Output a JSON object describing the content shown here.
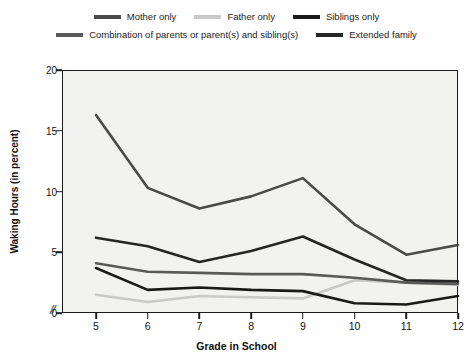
{
  "chart_data": {
    "type": "line",
    "title": "",
    "xlabel": "Grade in School",
    "ylabel": "Waking Hours (in percent)",
    "x": [
      5,
      6,
      7,
      8,
      9,
      10,
      11,
      12
    ],
    "xtick_labels": [
      "5",
      "6",
      "7",
      "8",
      "9",
      "10",
      "11",
      "12"
    ],
    "ytick_labels": [
      "0",
      "5",
      "10",
      "15",
      "20"
    ],
    "ytick_values": [
      0,
      5,
      10,
      15,
      20
    ],
    "ylim": [
      0,
      20
    ],
    "xlim": [
      5,
      12
    ],
    "x_axis_break": true,
    "x_axis_break_symbol": "//",
    "grid": false,
    "legend_position": "top",
    "plot_background": "#f2f2f0",
    "axis_color": "#1b1b1b",
    "series": [
      {
        "name": "Mother only",
        "color": "#4a4a4a",
        "values": [
          16.3,
          10.3,
          8.6,
          9.6,
          11.1,
          7.3,
          4.8,
          5.6
        ]
      },
      {
        "name": "Father only",
        "color": "#c9c9c9",
        "values": [
          1.5,
          0.9,
          1.4,
          1.3,
          1.2,
          2.7,
          2.5,
          2.3
        ]
      },
      {
        "name": "Siblings only",
        "color": "#1a1a1a",
        "values": [
          3.7,
          1.9,
          2.1,
          1.9,
          1.8,
          0.8,
          0.7,
          1.4
        ]
      },
      {
        "name": "Combination of parents or parent(s) and sibling(s)",
        "color": "#5a5a5a",
        "values": [
          4.1,
          3.4,
          3.3,
          3.2,
          3.2,
          2.9,
          2.5,
          2.4
        ]
      },
      {
        "name": "Extended family",
        "color": "#262626",
        "values": [
          6.2,
          5.5,
          4.2,
          5.1,
          6.3,
          4.4,
          2.7,
          2.6
        ]
      }
    ]
  },
  "legend": {
    "row1": [
      {
        "label": "Mother only",
        "color": "#4a4a4a"
      },
      {
        "label": "Father only",
        "color": "#c9c9c9"
      },
      {
        "label": "Siblings only",
        "color": "#1a1a1a"
      }
    ],
    "row2": [
      {
        "label": "Combination of parents or parent(s) and sibling(s)",
        "color": "#5a5a5a"
      },
      {
        "label": "Extended family",
        "color": "#262626"
      }
    ]
  }
}
